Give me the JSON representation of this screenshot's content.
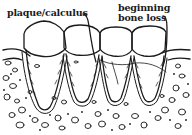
{
  "diagram": {
    "labels": {
      "plaque": "plaque/calculus",
      "bone_loss_line1": "beginning",
      "bone_loss_line2": "bone loss"
    },
    "tooth_count": 4,
    "colors": {
      "line": "#1a1a1a",
      "background": "#ffffff"
    }
  }
}
